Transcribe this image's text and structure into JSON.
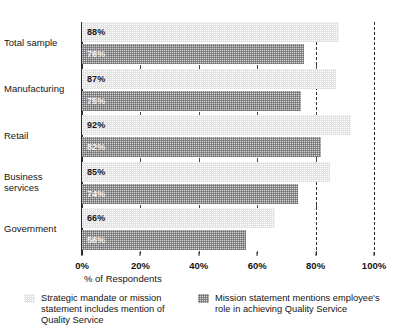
{
  "chart_data": {
    "type": "bar",
    "orientation": "horizontal",
    "title": "",
    "subtitle": "",
    "xlabel": "% of Respondents",
    "ylabel": "",
    "xlim": [
      0,
      100
    ],
    "xticks": [
      0,
      20,
      40,
      60,
      80,
      100
    ],
    "xticklabels": [
      "0%",
      "20%",
      "40%",
      "60%",
      "80%",
      "100%"
    ],
    "grid": "dashed vertical gridlines at 80% and 100%",
    "legend_position": "bottom",
    "categories": [
      "Total sample",
      "Manufacturing",
      "Retail",
      "Business services",
      "Government"
    ],
    "series": [
      {
        "name": "Strategic mandate or mission statement includes mention of Quality Service",
        "color": "#e3e3e3",
        "values": [
          88,
          87,
          92,
          85,
          66
        ],
        "labels": [
          "88%",
          "87%",
          "92%",
          "85%",
          "66%"
        ]
      },
      {
        "name": "Mission statement mentions employee's role in achieving Quality Service",
        "color": "#919191",
        "values": [
          76,
          75,
          82,
          74,
          56
        ],
        "labels": [
          "76%",
          "75%",
          "82%",
          "74%",
          "56%"
        ]
      }
    ]
  },
  "axis": {
    "title": "% of Respondents",
    "ticklabels": [
      "0%",
      "20%",
      "40%",
      "60%",
      "80%",
      "100%"
    ]
  },
  "categories": [
    {
      "label": "Total sample"
    },
    {
      "label": "Manufacturing"
    },
    {
      "label": "Retail"
    },
    {
      "label": "Business\nservices"
    },
    {
      "label": "Government"
    }
  ],
  "legend": [
    {
      "label": "Strategic mandate or mission\nstatement includes mention of\nQuality Service",
      "swatch": "light-dotted-swatch"
    },
    {
      "label": "Mission statement mentions employee's\nrole in achieving Quality Service",
      "swatch": "dark-dotted-swatch"
    }
  ]
}
